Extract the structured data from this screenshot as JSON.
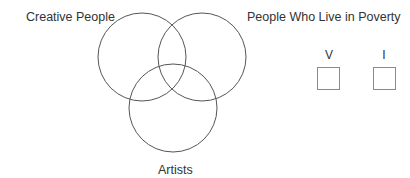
{
  "diagram": {
    "type": "venn",
    "sets": [
      {
        "name": "Creative People",
        "cx": 142,
        "cy": 57,
        "r": 44
      },
      {
        "name": "People Who Live in Poverty",
        "cx": 202,
        "cy": 57,
        "r": 44
      },
      {
        "name": "Artists",
        "cx": 173,
        "cy": 108,
        "r": 44
      }
    ],
    "labels": {
      "creative": "Creative People",
      "poverty": "People Who Live in Poverty",
      "artists": "Artists"
    },
    "stroke_color": "#555555"
  },
  "answer_boxes": [
    {
      "label": "V"
    },
    {
      "label": "I"
    }
  ]
}
